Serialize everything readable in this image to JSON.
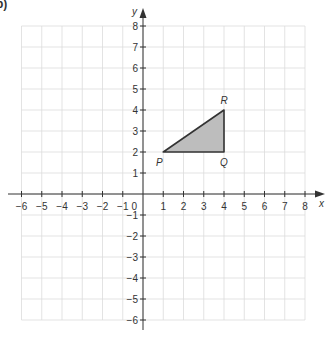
{
  "part_label": "b)",
  "chart_data": {
    "type": "scatter",
    "title": "",
    "xlabel": "x",
    "ylabel": "y",
    "xlim": [
      -6,
      8
    ],
    "ylim": [
      -6,
      8
    ],
    "grid": true,
    "x_ticks": [
      -6,
      -5,
      -4,
      -3,
      -2,
      -1,
      1,
      2,
      3,
      4,
      5,
      6,
      7,
      8
    ],
    "y_ticks": [
      -6,
      -5,
      -4,
      -3,
      -2,
      -1,
      1,
      2,
      3,
      4,
      5,
      6,
      7,
      8
    ],
    "origin_label": "0",
    "shapes": [
      {
        "type": "triangle",
        "fill": "#bdbdbd",
        "stroke": "#333333",
        "vertices": [
          {
            "label": "P",
            "x": 1,
            "y": 2
          },
          {
            "label": "Q",
            "x": 4,
            "y": 2
          },
          {
            "label": "R",
            "x": 4,
            "y": 4
          }
        ]
      }
    ]
  }
}
